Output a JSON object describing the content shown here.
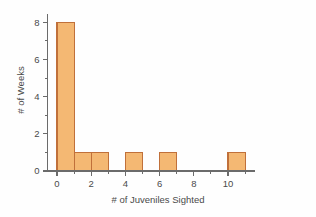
{
  "chart_data": {
    "type": "bar",
    "title": "",
    "subtitle": "",
    "xlabel": "# of Juveniles Sighted",
    "ylabel": "# of Weeks",
    "xlim": [
      -0.6,
      11.6
    ],
    "ylim": [
      0,
      8.6
    ],
    "grid": false,
    "legend": null,
    "bin_width": 1,
    "categories": [
      "0",
      "1",
      "2",
      "3",
      "4",
      "5",
      "6",
      "7",
      "8",
      "9",
      "10"
    ],
    "bin_starts": [
      0,
      1,
      2,
      3,
      4,
      5,
      6,
      7,
      8,
      9,
      10
    ],
    "values": [
      8,
      1,
      1,
      0,
      1,
      0,
      1,
      0,
      0,
      0,
      1
    ],
    "x_ticks_major": [
      0,
      2,
      4,
      6,
      8,
      10
    ],
    "x_tick_labels": [
      "0",
      "2",
      "4",
      "6",
      "8",
      "10"
    ],
    "x_ticks_minor": [
      1,
      3,
      5,
      7,
      9,
      11
    ],
    "y_ticks_major": [
      0,
      2,
      4,
      6,
      8
    ],
    "y_tick_labels": [
      "0",
      "2",
      "4",
      "6",
      "8"
    ],
    "y_ticks_minor": [
      1,
      3,
      5,
      7
    ],
    "axis_end_x": 11.6,
    "bar_fill": "#f4b873",
    "bar_stroke": "#c0703a",
    "axis_color": "#6b6b6b",
    "text_color": "#4a4a4a",
    "background": "#fefefe"
  }
}
